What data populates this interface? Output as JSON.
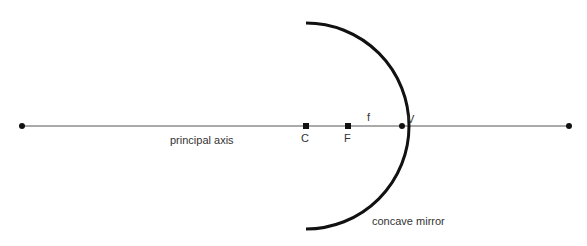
{
  "diagram": {
    "type": "concave-mirror-ray-diagram",
    "labels": {
      "principal_axis": "principal axis",
      "center": "C",
      "focus": "F",
      "focal_length": "f",
      "vertex": "V",
      "mirror": "concave mirror"
    },
    "colors": {
      "axis": "#555555",
      "mirror": "#111111",
      "points": "#111111",
      "text": "#333333"
    }
  }
}
